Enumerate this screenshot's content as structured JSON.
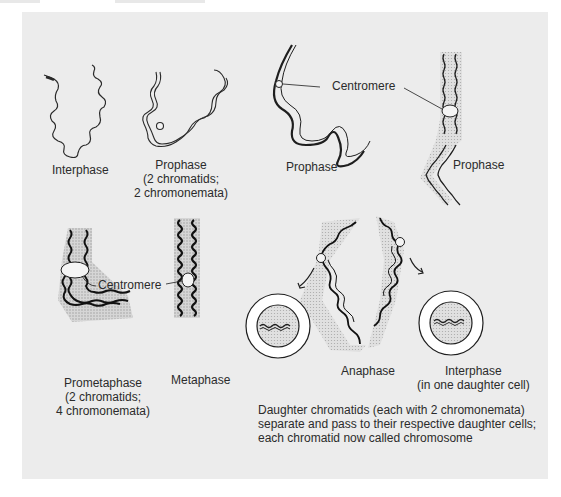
{
  "diagram": {
    "stages": [
      {
        "id": "interphase",
        "label": "Interphase"
      },
      {
        "id": "prophase-early",
        "label": "Prophase",
        "sub": [
          "(2 chromatids;",
          "2 chromonemata)"
        ]
      },
      {
        "id": "prophase-mid",
        "label": "Prophase"
      },
      {
        "id": "prophase-late",
        "label": "Prophase"
      },
      {
        "id": "prometaphase",
        "label": "Prometaphase",
        "sub": [
          "(2 chromatids;",
          "4 chromonemata)"
        ]
      },
      {
        "id": "metaphase",
        "label": "Metaphase"
      },
      {
        "id": "anaphase",
        "label": "Anaphase"
      },
      {
        "id": "interphase-daughter",
        "label": "Interphase",
        "sub": [
          "(in one daughter cell)"
        ]
      }
    ],
    "callouts": {
      "centromere_top": "Centromere",
      "centromere_bottom": "Centromere"
    },
    "caption": [
      "Daughter chromatids (each with 2 chromonemata)",
      "separate and pass to their respective daughter cells;",
      "each chromatid now called chromosome"
    ]
  },
  "colors": {
    "panel": "#ececec",
    "ink": "#1e1e1e",
    "halo": "#c9c9c9"
  }
}
